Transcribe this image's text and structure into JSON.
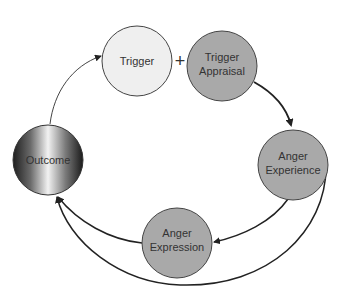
{
  "diagram": {
    "nodes": [
      {
        "id": "trigger",
        "lines": [
          "Trigger"
        ],
        "fill": "#efefef"
      },
      {
        "id": "trigger-appraisal",
        "lines": [
          "Trigger",
          "Appraisal"
        ],
        "fill": "#a9a9a9"
      },
      {
        "id": "anger-experience",
        "lines": [
          "Anger",
          "Experience"
        ],
        "fill": "#a9a9a9"
      },
      {
        "id": "anger-expression",
        "lines": [
          "Anger",
          "Expression"
        ],
        "fill": "#a9a9a9"
      },
      {
        "id": "outcome",
        "lines": [
          "Outcome"
        ],
        "fill": "gradient"
      }
    ],
    "operator": "+",
    "edges": [
      {
        "from": "trigger-appraisal",
        "to": "anger-experience"
      },
      {
        "from": "anger-experience",
        "to": "anger-expression"
      },
      {
        "from": "anger-experience",
        "to": "outcome"
      },
      {
        "from": "anger-expression",
        "to": "outcome"
      },
      {
        "from": "outcome",
        "to": "trigger"
      }
    ],
    "colors": {
      "light_node": "#efefef",
      "dark_node": "#a9a9a9",
      "stroke": "#333333",
      "arrow": "#222222"
    }
  }
}
